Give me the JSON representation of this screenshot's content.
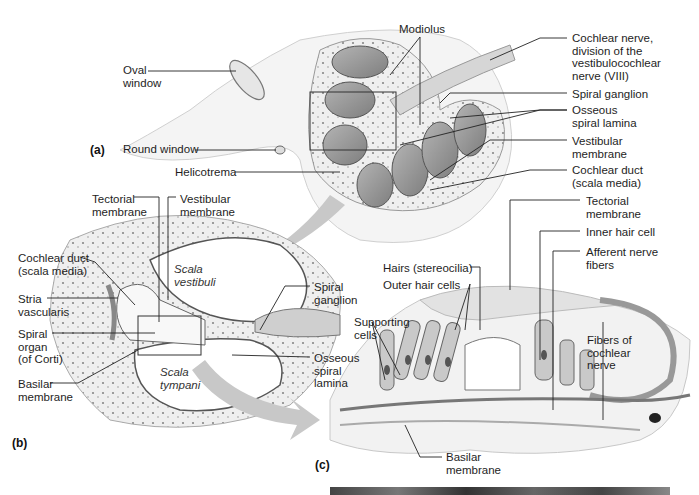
{
  "figure": {
    "panels": {
      "a": "(a)",
      "b": "(b)",
      "c": "(c)"
    },
    "panel_a_labels": {
      "modiolus": "Modiolus",
      "cochlear_nerve": "Cochlear nerve,\ndivision of the\nvestibulocochlear\nnerve (VIII)",
      "oval_window": "Oval\nwindow",
      "spiral_ganglion": "Spiral ganglion",
      "osseous_spiral_lamina": "Osseous\nspiral lamina",
      "round_window": "Round window",
      "vestibular_membrane": "Vestibular\nmembrane",
      "helicotrema": "Helicotrema",
      "cochlear_duct": "Cochlear duct\n(scala media)"
    },
    "panel_b_labels": {
      "tectorial_membrane": "Tectorial\nmembrane",
      "vestibular_membrane": "Vestibular\nmembrane",
      "cochlear_duct": "Cochlear duct\n(scala media)",
      "scala_vestibuli": "Scala\nvestibuli",
      "stria_vascularis": "Stria\nvascularis",
      "spiral_ganglion": "Spiral\nganglion",
      "spiral_organ": "Spiral\norgan\n(of Corti)",
      "osseous_spiral_lamina": "Osseous\nspiral\nlamina",
      "scala_tympani": "Scala\ntympani",
      "basilar_membrane": "Basilar\nmembrane"
    },
    "panel_c_labels": {
      "tectorial_membrane": "Tectorial\nmembrane",
      "inner_hair_cell": "Inner hair cell",
      "afferent_nerve_fibers": "Afferent nerve\nfibers",
      "hairs_stereocilia": "Hairs (stereocilia)",
      "outer_hair_cells": "Outer hair cells",
      "supporting_cells": "Supporting\ncells",
      "fibers_of_cochlear_nerve": "Fibers of\ncochlear\nnerve",
      "basilar_membrane": "Basilar\nmembrane"
    },
    "colors": {
      "tissue": "#d9d9d9",
      "tissue_dark": "#9a9a9a",
      "bone": "#ececec",
      "arrow": "#c8c8c8",
      "line": "#222222"
    }
  }
}
